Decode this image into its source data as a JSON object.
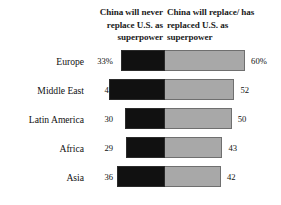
{
  "chart_data": {
    "type": "bar",
    "subtype": "diverging-stacked-bar",
    "title": "",
    "subtitle": "",
    "xlabel": "",
    "ylabel": "",
    "grid": false,
    "legend_position": "top",
    "axis_unit": "percent",
    "value_suffix_first_row_only": "%",
    "categories": [
      "Europe",
      "Middle East",
      "Latin America",
      "Africa",
      "Asia"
    ],
    "series": [
      {
        "name": "China will never replace U.S. as superpower",
        "color": "#111111",
        "direction": "left",
        "values": [
          33,
          42,
          30,
          29,
          36
        ],
        "labels": [
          "33%",
          "42",
          "30",
          "29",
          "36"
        ]
      },
      {
        "name": "China will replace/has replaced U.S. as superpower",
        "color": "#a8a8a8",
        "direction": "right",
        "values": [
          60,
          52,
          50,
          43,
          42
        ],
        "labels": [
          "60%",
          "52",
          "50",
          "43",
          "42"
        ]
      }
    ]
  },
  "headers": {
    "left": "China will never replace U.S. as superpower",
    "right": "China will replace/ has replaced U.S. as superpower"
  },
  "rows": [
    {
      "region": "Europe",
      "left_value": "33%",
      "right_value": "60%"
    },
    {
      "region": "Middle East",
      "left_value": "42",
      "right_value": "52"
    },
    {
      "region": "Latin America",
      "left_value": "30",
      "right_value": "50"
    },
    {
      "region": "Africa",
      "left_value": "29",
      "right_value": "43"
    },
    {
      "region": "Asia",
      "left_value": "36",
      "right_value": "42"
    }
  ],
  "colors": {
    "never": "#111111",
    "replace": "#a8a8a8",
    "background": "#ffffff",
    "text": "#111111"
  }
}
